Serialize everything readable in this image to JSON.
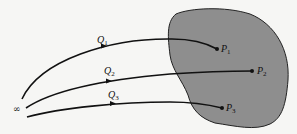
{
  "diagram": {
    "region": {
      "fill": "#8e8e8e",
      "stroke": "#222222"
    },
    "origin": {
      "label": "∞"
    },
    "paths": [
      {
        "label": "Q",
        "sub": "1",
        "end_label": "P",
        "end_sub": "1"
      },
      {
        "label": "Q",
        "sub": "2",
        "end_label": "P",
        "end_sub": "2"
      },
      {
        "label": "Q",
        "sub": "3",
        "end_label": "P",
        "end_sub": "3"
      }
    ]
  }
}
